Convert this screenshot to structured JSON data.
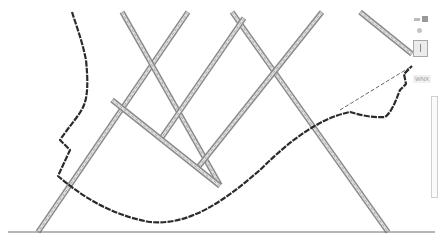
{
  "map": {
    "type": "street-map-line-drawing",
    "colors": {
      "background": "#ffffff",
      "road_casing": "#8a8a8a",
      "road_fill": "#e4e4e4",
      "boundary": "#2b2b2b",
      "baseline": "#6e6e6e"
    },
    "roads": [
      {
        "name": "road-diagonal-1",
        "d": "M188,12 L38,232"
      },
      {
        "name": "road-diagonal-2",
        "d": "M122,12 L220,185"
      },
      {
        "name": "road-diagonal-3",
        "d": "M232,12 L388,232"
      },
      {
        "name": "road-diagonal-4",
        "d": "M242,22 L162,136"
      },
      {
        "name": "road-diagonal-5",
        "d": "M322,12 L198,160"
      },
      {
        "name": "road-diagonal-6",
        "d": "M360,12 L412,52"
      },
      {
        "name": "road-cross-1",
        "d": "M112,100 L220,188"
      }
    ],
    "boundary_path": "M72,12 C76,25 82,40 86,60 C88,80 88,95 84,105 C80,115 70,125 60,140 L70,150 L58,176 C80,195 110,215 150,222 C190,226 225,200 260,170 C290,140 320,118 350,112 C360,115 372,118 385,117 C392,112 396,100 400,90 L406,84 L404,74 L412,66",
    "dashed_link": "M340,110 L412,66",
    "baseline": {
      "x1": 8,
      "y1": 232,
      "x2": 435,
      "y2": 232
    },
    "controls": {
      "zoom": "zoom-controls",
      "person": "pegman-icon",
      "layers": "layers-box"
    },
    "label_text": "WNX",
    "side_panel": "scroll-panel"
  }
}
